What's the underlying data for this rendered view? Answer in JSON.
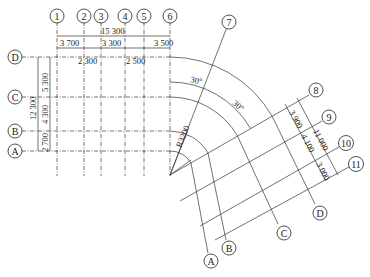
{
  "drawing": {
    "title": "Grid axis plan with radial/rotated axes",
    "vertical_axes": [
      {
        "label": "1",
        "x": 57
      },
      {
        "label": "2",
        "x": 84
      },
      {
        "label": "3",
        "x": 101
      },
      {
        "label": "4",
        "x": 125
      },
      {
        "label": "5",
        "x": 144
      },
      {
        "label": "6",
        "x": 170
      }
    ],
    "horizontal_axes": [
      {
        "label": "D",
        "y": 57
      },
      {
        "label": "C",
        "y": 97
      },
      {
        "label": "B",
        "y": 131
      },
      {
        "label": "A",
        "y": 151
      }
    ],
    "top_dimensions": {
      "total": "15 300",
      "segments": [
        "3 700",
        "3 300",
        "3 500"
      ],
      "inner": [
        "2 300",
        "2 500"
      ]
    },
    "left_dimensions": {
      "total": "12 300",
      "segments": [
        "5 300",
        "4 300",
        "2 700"
      ]
    },
    "radial": {
      "center_label": "R3200",
      "angle_1": "30°",
      "angle_2": "30°",
      "radial_axis": "7"
    },
    "rotated_axes": {
      "numbered": [
        "8",
        "9",
        "10",
        "11"
      ],
      "lettered": [
        "A",
        "B",
        "C",
        "D"
      ],
      "dimensions": {
        "total": "11 000",
        "segments": [
          "3 900",
          "4 100",
          "3 000"
        ]
      }
    }
  }
}
